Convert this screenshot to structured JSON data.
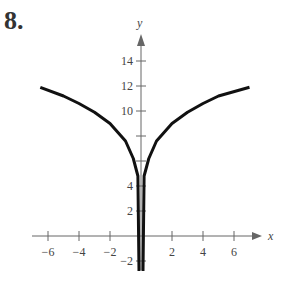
{
  "problem_number": "8.",
  "chart_data": {
    "type": "line",
    "title": "",
    "xlabel": "x",
    "ylabel": "y",
    "xlim": [
      -6.5,
      7
    ],
    "ylim": [
      -2.5,
      15.5
    ],
    "x_ticks": [
      -6,
      -4,
      -2,
      2,
      4,
      6
    ],
    "y_ticks": [
      -2,
      2,
      4,
      6,
      8,
      10,
      12,
      14
    ],
    "x_tick_labels": [
      "−6",
      "−4",
      "−2",
      "2",
      "4",
      "6"
    ],
    "y_tick_labels": [
      "−2",
      "2",
      "4",
      "10",
      "12",
      "14"
    ],
    "grid": false,
    "series": [
      {
        "name": "left branch",
        "x": [
          -6.5,
          -5,
          -4,
          -3,
          -2,
          -1,
          -0.5,
          -0.2,
          0
        ],
        "y": [
          11.9,
          11.2,
          10.6,
          9.9,
          9.0,
          7.6,
          6.2,
          4.8,
          -2.8
        ]
      },
      {
        "name": "right branch",
        "x": [
          0,
          0.2,
          0.5,
          1,
          2,
          3,
          4,
          5,
          7
        ],
        "y": [
          -2.8,
          4.8,
          6.2,
          7.6,
          9.0,
          9.9,
          10.6,
          11.2,
          11.9
        ]
      }
    ],
    "asymptote": {
      "x": 0,
      "description": "vertical asymptote along y-axis"
    }
  }
}
